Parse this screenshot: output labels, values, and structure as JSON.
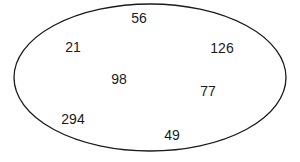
{
  "diagram": {
    "shape": "ellipse",
    "stroke_color": "#1a1a1a",
    "numbers": [
      {
        "label": "56",
        "x": 139,
        "y": 18
      },
      {
        "label": "21",
        "x": 73,
        "y": 47
      },
      {
        "label": "126",
        "x": 222,
        "y": 48
      },
      {
        "label": "98",
        "x": 119,
        "y": 79
      },
      {
        "label": "77",
        "x": 208,
        "y": 91
      },
      {
        "label": "294",
        "x": 73,
        "y": 119
      },
      {
        "label": "49",
        "x": 172,
        "y": 135
      }
    ]
  }
}
